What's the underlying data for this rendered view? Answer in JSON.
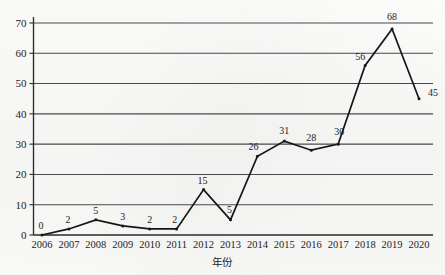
{
  "chart_data": {
    "type": "line",
    "title": "",
    "xlabel": "年份",
    "ylabel": "",
    "categories": [
      "2006",
      "2007",
      "2008",
      "2009",
      "2010",
      "2011",
      "2012",
      "2013",
      "2014",
      "2015",
      "2016",
      "2017",
      "2018",
      "2019",
      "2020"
    ],
    "values": [
      0,
      2,
      5,
      3,
      2,
      2,
      15,
      5,
      26,
      31,
      28,
      30,
      56,
      68,
      45
    ],
    "data_labels": [
      "0",
      "2",
      "5",
      "3",
      "2",
      "2",
      "15",
      "5",
      "26",
      "31",
      "28",
      "30",
      "56",
      "68",
      "45"
    ],
    "ylim": [
      0,
      70
    ],
    "y_ticks": [
      "0",
      "10",
      "20",
      "30",
      "40",
      "50",
      "60",
      "70"
    ],
    "y_tick_values": [
      0,
      10,
      20,
      30,
      40,
      50,
      60,
      70
    ],
    "grid": true,
    "grid_axis": "y",
    "legend": false,
    "legend_position": "none",
    "marker": "dot",
    "line_color": "#161616",
    "grid_color": "#4a4a4a",
    "background_color": "#fbfbfa"
  },
  "axes": {
    "y_axis_name": "value-axis",
    "x_axis_name": "year-axis",
    "x_axis_title": "年份"
  }
}
